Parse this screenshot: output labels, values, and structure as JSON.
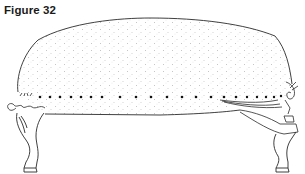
{
  "figure": {
    "caption": "Figure 32",
    "colors": {
      "line": "#2a2a2a",
      "stipple": "#8a8a8a",
      "background": "#ffffff"
    },
    "pins": {
      "count": 26,
      "y": 97,
      "x_start": 40,
      "x_end": 282
    }
  }
}
